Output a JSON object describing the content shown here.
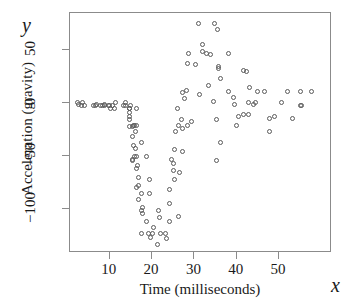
{
  "chart_data": {
    "type": "scatter",
    "title": "",
    "xlabel": "Time (milliseconds)",
    "ylabel": "Acceleration (gravity)",
    "x_symbol": "x",
    "y_symbol": "y",
    "xlim": [
      0.6,
      62.5
    ],
    "ylim": [
      -142,
      85
    ],
    "xticks": [
      10,
      20,
      30,
      40,
      50
    ],
    "yticks": [
      50,
      0,
      -50,
      -100
    ],
    "ytick_labels": [
      "50",
      "0",
      "−50",
      "−100"
    ],
    "xtick_labels": [
      "10",
      "20",
      "30",
      "40",
      "50"
    ],
    "grid": false,
    "legend": false,
    "marker": "open-circle",
    "marker_color": "#5a5a5a",
    "frame_color": "#8b8b8b",
    "n_points": 133,
    "x": [
      2.4,
      2.6,
      3.2,
      3.6,
      4.0,
      6.2,
      6.6,
      6.8,
      7.8,
      8.2,
      8.8,
      8.8,
      9.6,
      10.0,
      10.2,
      10.6,
      11.0,
      11.4,
      13.2,
      13.6,
      13.8,
      14.6,
      14.6,
      14.6,
      14.6,
      14.6,
      14.6,
      14.8,
      15.4,
      15.4,
      15.4,
      15.4,
      15.6,
      15.6,
      15.8,
      15.8,
      16.0,
      16.0,
      16.2,
      16.2,
      16.2,
      16.4,
      16.4,
      16.6,
      16.8,
      16.8,
      16.8,
      17.6,
      17.6,
      17.6,
      17.6,
      17.8,
      17.8,
      18.6,
      18.6,
      19.2,
      19.4,
      19.4,
      19.6,
      20.2,
      20.4,
      21.2,
      21.4,
      21.8,
      22.0,
      23.2,
      23.4,
      24.0,
      24.2,
      24.2,
      24.6,
      25.0,
      25.0,
      25.4,
      25.4,
      25.6,
      26.0,
      26.2,
      26.2,
      26.4,
      27.0,
      27.2,
      27.2,
      27.2,
      27.6,
      28.2,
      28.4,
      28.4,
      28.6,
      29.4,
      30.2,
      31.0,
      31.2,
      32.0,
      32.0,
      32.8,
      33.4,
      33.8,
      34.4,
      34.8,
      35.2,
      35.2,
      35.4,
      35.6,
      35.6,
      36.2,
      36.2,
      38.0,
      38.0,
      39.2,
      39.4,
      40.0,
      40.4,
      41.6,
      41.6,
      42.4,
      42.8,
      42.8,
      43.0,
      44.0,
      44.4,
      45.0,
      46.6,
      47.8,
      47.8,
      48.8,
      50.6,
      52.0,
      53.2,
      55.0,
      55.0,
      55.4,
      57.6
    ],
    "y": [
      0.0,
      -1.3,
      -2.7,
      0.0,
      -2.7,
      -2.7,
      -2.7,
      -1.3,
      -2.7,
      -2.7,
      -1.3,
      -2.7,
      -2.7,
      -2.7,
      -5.4,
      -2.7,
      -5.4,
      0.0,
      -2.7,
      -2.7,
      0.0,
      -13.3,
      -5.4,
      -5.4,
      -9.3,
      -16.0,
      -22.8,
      -2.7,
      -22.8,
      -32.1,
      -53.5,
      -54.9,
      -40.2,
      -21.5,
      -21.5,
      -50.8,
      -42.9,
      -26.8,
      -21.5,
      -50.8,
      -61.7,
      -5.4,
      -80.4,
      -59.0,
      -71.0,
      -91.1,
      -77.7,
      -37.5,
      -85.6,
      -123.1,
      -101.9,
      -99.1,
      -104.4,
      -112.5,
      -50.8,
      -123.1,
      -85.6,
      -72.3,
      -127.2,
      -123.1,
      -117.9,
      -134.0,
      -101.9,
      -108.4,
      -123.1,
      -123.1,
      -128.5,
      -112.5,
      -95.1,
      -81.8,
      -53.5,
      -64.4,
      -57.6,
      -72.3,
      -44.3,
      -26.8,
      -5.4,
      -107.1,
      -21.5,
      -65.6,
      -16.0,
      -45.6,
      -24.2,
      9.5,
      4.0,
      12.0,
      -21.5,
      37.5,
      46.9,
      -17.4,
      36.2,
      75.0,
      8.1,
      54.9,
      48.2,
      46.9,
      16.0,
      45.6,
      1.3,
      75.0,
      -16.0,
      -54.9,
      69.6,
      34.8,
      32.1,
      -37.5,
      22.8,
      46.9,
      10.7,
      5.4,
      -1.3,
      -21.5,
      -13.3,
      30.8,
      -10.7,
      29.4,
      0.0,
      -10.7,
      14.7,
      -1.3,
      0.0,
      10.7,
      10.7,
      -26.8,
      -14.7,
      -13.3,
      0.0,
      10.7,
      -14.7,
      -2.7,
      10.7,
      -2.7,
      10.7
    ]
  }
}
